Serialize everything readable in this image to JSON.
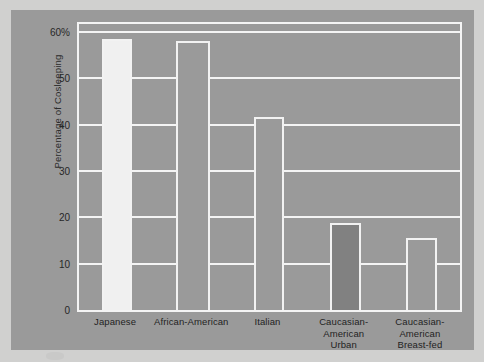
{
  "chart_data": {
    "type": "bar",
    "title": "",
    "subtitle": "",
    "xlabel": "",
    "ylabel": "Percentage of Cosleeping",
    "ylim": [
      0,
      60
    ],
    "ytick_values": [
      0,
      10,
      20,
      30,
      40,
      50,
      60
    ],
    "ytick_labels": [
      "0",
      "10",
      "20",
      "30",
      "40",
      "50",
      "60%"
    ],
    "grid": true,
    "legend": "none",
    "categories": [
      "Japanese",
      "African-American",
      "Italian",
      "Caucasian-American Urban",
      "Caucasian-American Breast-fed"
    ],
    "category_label_lines": [
      [
        "Japanese"
      ],
      [
        "African-American"
      ],
      [
        "Italian"
      ],
      [
        "Caucasian-",
        "American",
        "Urban"
      ],
      [
        "Caucasian-",
        "American",
        "Breast-fed"
      ]
    ],
    "values": [
      58.5,
      58.0,
      41.7,
      18.7,
      15.6
    ],
    "bar_fills": [
      "#f0f0f0",
      "#9a9a9a",
      "#9a9a9a",
      "#818181",
      "#9a9a9a"
    ],
    "bar_outline_color": "#f2f2f2"
  },
  "style": {
    "page_background": "#d0d0cf",
    "panel_background": "#9a9a9a",
    "grid_color": "#f4f4f4",
    "text_color": "#272727"
  }
}
